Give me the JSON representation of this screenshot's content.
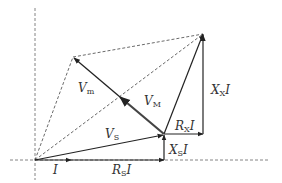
{
  "diagram": {
    "points": {
      "O": [
        35,
        160
      ],
      "I_tip": [
        71,
        160
      ],
      "P_RS": [
        164,
        160
      ],
      "A": [
        164,
        134
      ],
      "P_RX": [
        203,
        134
      ],
      "B": [
        203,
        34
      ],
      "Vm_tip": [
        73,
        57
      ],
      "VM_mid": [
        119,
        96
      ]
    },
    "axes": {
      "horizontal": {
        "y": 160,
        "x_from": 10,
        "x_to": 268
      },
      "vertical": {
        "x": 35,
        "y_from": 8,
        "y_to": 180
      }
    },
    "colors": {
      "line": "#222222",
      "dashed": "#555555",
      "thick": "#444444",
      "text": "#333333"
    }
  },
  "labels": {
    "I": {
      "main": "I",
      "sub": ""
    },
    "RsI": {
      "main": "R",
      "sub": "S",
      "tail": "I"
    },
    "XsI": {
      "main": "X",
      "sub": "S",
      "tail": "I"
    },
    "RxI": {
      "main": "R",
      "sub": "X",
      "tail": "I"
    },
    "XxI": {
      "main": "X",
      "sub": "X",
      "tail": "I"
    },
    "Vs": {
      "main": "V",
      "sub": "S"
    },
    "VM": {
      "main": "V",
      "sub": "M"
    },
    "Vm": {
      "main": "V",
      "sub": "m"
    }
  }
}
